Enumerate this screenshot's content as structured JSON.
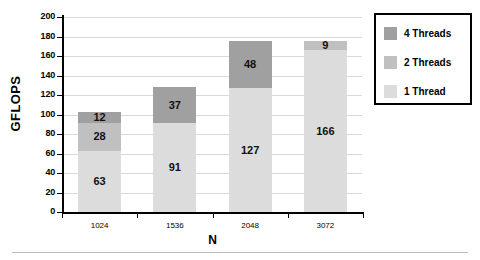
{
  "chart_data": {
    "type": "bar",
    "subtype": "stacked-bar",
    "title": "",
    "xlabel": "N",
    "ylabel": "GFLOPS",
    "categories": [
      "1024",
      "1536",
      "2048",
      "3072"
    ],
    "series": [
      {
        "name": "1 Thread",
        "color": "#dcdcdc",
        "values": [
          63,
          91,
          127,
          166
        ]
      },
      {
        "name": "2 Threads",
        "color": "#c0c0c0",
        "values": [
          28,
          0,
          0,
          9
        ]
      },
      {
        "name": "4 Threads",
        "color": "#a0a0a0",
        "values": [
          12,
          37,
          48,
          0
        ]
      }
    ],
    "bar_labels": [
      [
        "63",
        "28",
        "12"
      ],
      [
        "91",
        "",
        "37"
      ],
      [
        "127",
        "",
        "48"
      ],
      [
        "166",
        "9",
        ""
      ]
    ],
    "totals": [
      103,
      128,
      175,
      175
    ],
    "ylim": [
      0,
      200
    ],
    "yticks": [
      "0",
      "20",
      "40",
      "60",
      "80",
      "100",
      "120",
      "140",
      "160",
      "180",
      "200"
    ],
    "ytick_values": [
      0,
      20,
      40,
      60,
      80,
      100,
      120,
      140,
      160,
      180,
      200
    ],
    "grid": true,
    "grid_axis": "y",
    "legend_position": "right",
    "legend_entries": [
      {
        "label": "4 Threads",
        "color": "#a0a0a0"
      },
      {
        "label": "2 Threads",
        "color": "#c0c0c0"
      },
      {
        "label": "1 Thread",
        "color": "#dcdcdc"
      }
    ]
  }
}
